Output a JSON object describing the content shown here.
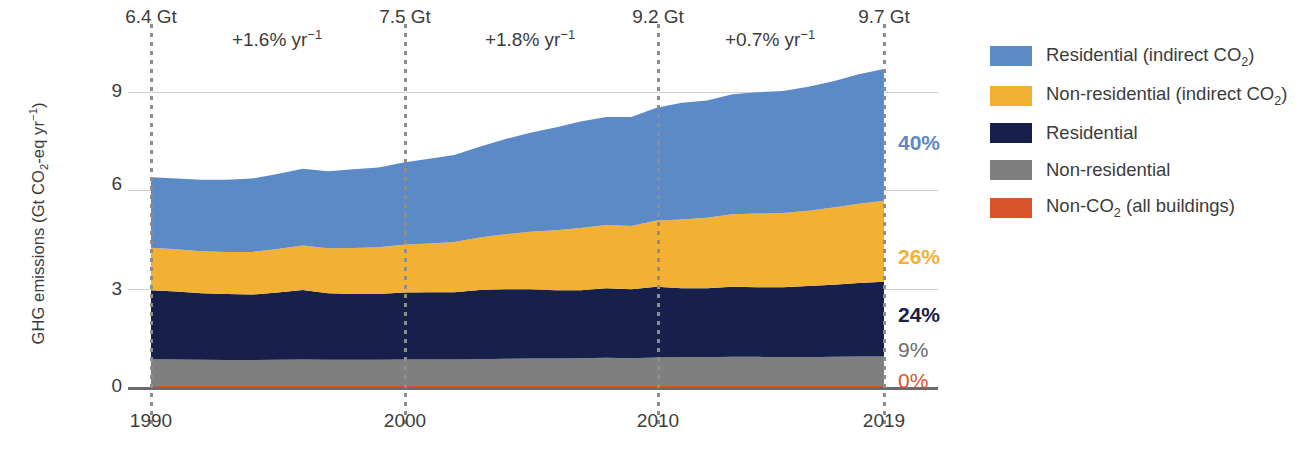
{
  "chart_data": {
    "type": "area",
    "title": "",
    "xlabel": "",
    "ylabel": "GHG emissions (Gt CO2-eq yr-1)",
    "ylabel_parts": {
      "pre": "GHG emissions (Gt CO",
      "sub1": "2",
      "mid": "-eq yr",
      "sup1": "−1",
      "post": ")"
    },
    "ylim": [
      0,
      10.1
    ],
    "xlim": [
      1990,
      2019
    ],
    "yticks": [
      "0",
      "3",
      "6",
      "9"
    ],
    "ytick_values": [
      0,
      3,
      6,
      9
    ],
    "xticks": [
      "1990",
      "2000",
      "2010",
      "2019"
    ],
    "xtick_values": [
      1990,
      2000,
      2010,
      2019
    ],
    "grid": "horizontal",
    "legend_position": "right",
    "stacked": true,
    "x": [
      1990,
      1991,
      1992,
      1993,
      1994,
      1995,
      1996,
      1997,
      1998,
      1999,
      2000,
      2001,
      2002,
      2003,
      2004,
      2005,
      2006,
      2007,
      2008,
      2009,
      2010,
      2011,
      2012,
      2013,
      2014,
      2015,
      2016,
      2017,
      2018,
      2019
    ],
    "series": [
      {
        "name": "Non-CO2 (all buildings)",
        "color": "#D9542B",
        "order": 1,
        "values": [
          0.03,
          0.03,
          0.03,
          0.03,
          0.03,
          0.03,
          0.03,
          0.03,
          0.03,
          0.03,
          0.03,
          0.03,
          0.03,
          0.03,
          0.03,
          0.03,
          0.03,
          0.03,
          0.03,
          0.03,
          0.03,
          0.03,
          0.03,
          0.03,
          0.03,
          0.03,
          0.03,
          0.03,
          0.03,
          0.03
        ]
      },
      {
        "name": "Non-residential",
        "color": "#7F7F7F",
        "order": 2,
        "values": [
          0.82,
          0.81,
          0.8,
          0.79,
          0.79,
          0.8,
          0.81,
          0.8,
          0.8,
          0.8,
          0.81,
          0.81,
          0.81,
          0.82,
          0.83,
          0.84,
          0.84,
          0.85,
          0.86,
          0.85,
          0.87,
          0.88,
          0.88,
          0.89,
          0.89,
          0.88,
          0.88,
          0.89,
          0.9,
          0.9
        ]
      },
      {
        "name": "Residential",
        "color": "#16204A",
        "order": 3,
        "values": [
          2.1,
          2.07,
          2.03,
          2.02,
          2.0,
          2.05,
          2.12,
          2.03,
          2.01,
          2.01,
          2.04,
          2.05,
          2.05,
          2.11,
          2.12,
          2.11,
          2.08,
          2.07,
          2.12,
          2.1,
          2.16,
          2.1,
          2.1,
          2.14,
          2.12,
          2.13,
          2.17,
          2.2,
          2.24,
          2.28
        ]
      },
      {
        "name": "Non-residential (indirect CO2)",
        "color": "#F3B134",
        "order": 4,
        "values": [
          1.3,
          1.29,
          1.28,
          1.28,
          1.3,
          1.33,
          1.36,
          1.37,
          1.4,
          1.42,
          1.46,
          1.49,
          1.53,
          1.6,
          1.68,
          1.76,
          1.83,
          1.9,
          1.93,
          1.93,
          2.02,
          2.1,
          2.15,
          2.21,
          2.25,
          2.27,
          2.3,
          2.36,
          2.42,
          2.47
        ]
      },
      {
        "name": "Residential (indirect CO2)",
        "color": "#5C8AC6",
        "order": 5,
        "values": [
          2.15,
          2.16,
          2.18,
          2.2,
          2.24,
          2.29,
          2.34,
          2.35,
          2.4,
          2.44,
          2.51,
          2.58,
          2.66,
          2.77,
          2.9,
          3.02,
          3.14,
          3.25,
          3.3,
          3.33,
          3.44,
          3.56,
          3.58,
          3.66,
          3.7,
          3.72,
          3.78,
          3.85,
          3.95,
          4.02
        ]
      }
    ],
    "annotations": {
      "totals": [
        {
          "x": 1990,
          "label": "6.4 Gt",
          "value": 6.4
        },
        {
          "x": 2000,
          "label": "7.5 Gt",
          "value": 7.5
        },
        {
          "x": 2010,
          "label": "9.2 Gt",
          "value": 9.2
        },
        {
          "x": 2019,
          "label": "9.7 Gt",
          "value": 9.7
        }
      ],
      "rates": [
        {
          "from": 1990,
          "to": 2000,
          "label": "+1.6% yr",
          "sup": "−1"
        },
        {
          "from": 2000,
          "to": 2010,
          "label": "+1.8% yr",
          "sup": "−1"
        },
        {
          "from": 2010,
          "to": 2019,
          "label": "+0.7% yr",
          "sup": "−1"
        }
      ],
      "shares_2019": [
        {
          "label": "40%",
          "value": 40,
          "color": "#5C8AC6",
          "series": "Residential (indirect CO2)"
        },
        {
          "label": "26%",
          "value": 26,
          "color": "#F3B134",
          "series": "Non-residential (indirect CO2)"
        },
        {
          "label": "24%",
          "value": 24,
          "color": "#16204A",
          "series": "Residential"
        },
        {
          "label": "9%",
          "value": 9,
          "color": "#7F7F7F",
          "series": "Non-residential"
        },
        {
          "label": "0%",
          "value": 0,
          "color": "#D9542B",
          "series": "Non-CO2 (all buildings)"
        }
      ]
    }
  },
  "legend": {
    "items": [
      {
        "label_pre": "Residential (indirect CO",
        "sub": "2",
        "label_post": ")",
        "color": "#5C8AC6",
        "name": "residential-indirect-co2"
      },
      {
        "label_pre": "Non-residential (indirect CO",
        "sub": "2",
        "label_post": ")",
        "color": "#F3B134",
        "name": "non-residential-indirect-co2"
      },
      {
        "label_pre": "Residential",
        "sub": "",
        "label_post": "",
        "color": "#16204A",
        "name": "residential"
      },
      {
        "label_pre": "Non-residential",
        "sub": "",
        "label_post": "",
        "color": "#7F7F7F",
        "name": "non-residential"
      },
      {
        "label_pre": "Non-CO",
        "sub": "2",
        "label_post": " (all buildings)",
        "color": "#D9542B",
        "name": "non-co2-all-buildings"
      }
    ]
  },
  "colors": {
    "blue": "#5C8AC6",
    "yellow": "#F3B134",
    "navy": "#16204A",
    "gray": "#7F7F7F",
    "orange": "#D9542B",
    "grid": "#cfcfcf",
    "axis": "#6b6b6b",
    "text": "#3c3c3c"
  }
}
